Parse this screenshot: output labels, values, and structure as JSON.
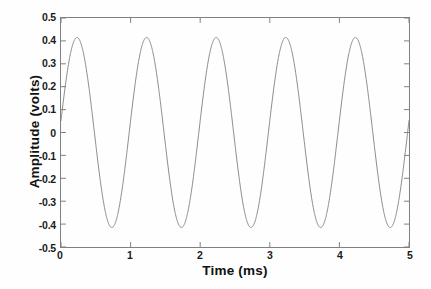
{
  "chart_data": {
    "type": "line",
    "title": "",
    "xlabel": "Time (ms)",
    "ylabel": "Amplitude (volts)",
    "xlim": [
      0,
      5
    ],
    "ylim": [
      -0.5,
      0.5
    ],
    "xticks": [
      "0",
      "1",
      "2",
      "3",
      "4",
      "5"
    ],
    "xtick_values": [
      0,
      1,
      2,
      3,
      4,
      5
    ],
    "yticks": [
      "0.5",
      "0.4",
      "0.3",
      "0.2",
      "0.1",
      "0",
      "-0.1",
      "-0.2",
      "-0.3",
      "-0.4",
      "-0.5"
    ],
    "ytick_values": [
      0.5,
      0.4,
      0.3,
      0.2,
      0.1,
      0,
      -0.1,
      -0.2,
      -0.3,
      -0.4,
      -0.5
    ],
    "grid": false,
    "legend": null,
    "line_color": "#7d7d7d",
    "line_width": 0.9,
    "series": [
      {
        "name": "waveform",
        "description": "1 kHz sinusoid, amplitude 0.415 V, starting phase approximately 0.12 rad rising",
        "amplitude": 0.415,
        "frequency_khz": 1.0,
        "period_ms": 1.0,
        "cycles": 5,
        "phase_offset_ms": -0.02,
        "peak_value": 0.41,
        "trough_value": -0.42,
        "peak_times_ms": [
          0.23,
          1.23,
          2.23,
          3.23,
          4.23
        ],
        "trough_times_ms": [
          0.73,
          1.73,
          2.73,
          3.73,
          4.73
        ],
        "start_value": 0.05,
        "end_value": -0.05,
        "x": [
          0,
          0.25,
          0.5,
          0.75,
          1,
          1.25,
          1.5,
          1.75,
          2,
          2.25,
          2.5,
          2.75,
          3,
          3.25,
          3.5,
          3.75,
          4,
          4.25,
          4.5,
          4.75,
          5
        ],
        "values": [
          0.05,
          0.41,
          0.05,
          -0.42,
          -0.05,
          0.41,
          0.05,
          -0.42,
          -0.05,
          0.41,
          0.05,
          -0.42,
          -0.05,
          0.41,
          0.05,
          -0.42,
          -0.05,
          0.41,
          0.05,
          -0.42,
          -0.05
        ]
      }
    ]
  },
  "axes": {
    "xlabel": "Time (ms)",
    "ylabel": "Amplitude (volts)"
  }
}
